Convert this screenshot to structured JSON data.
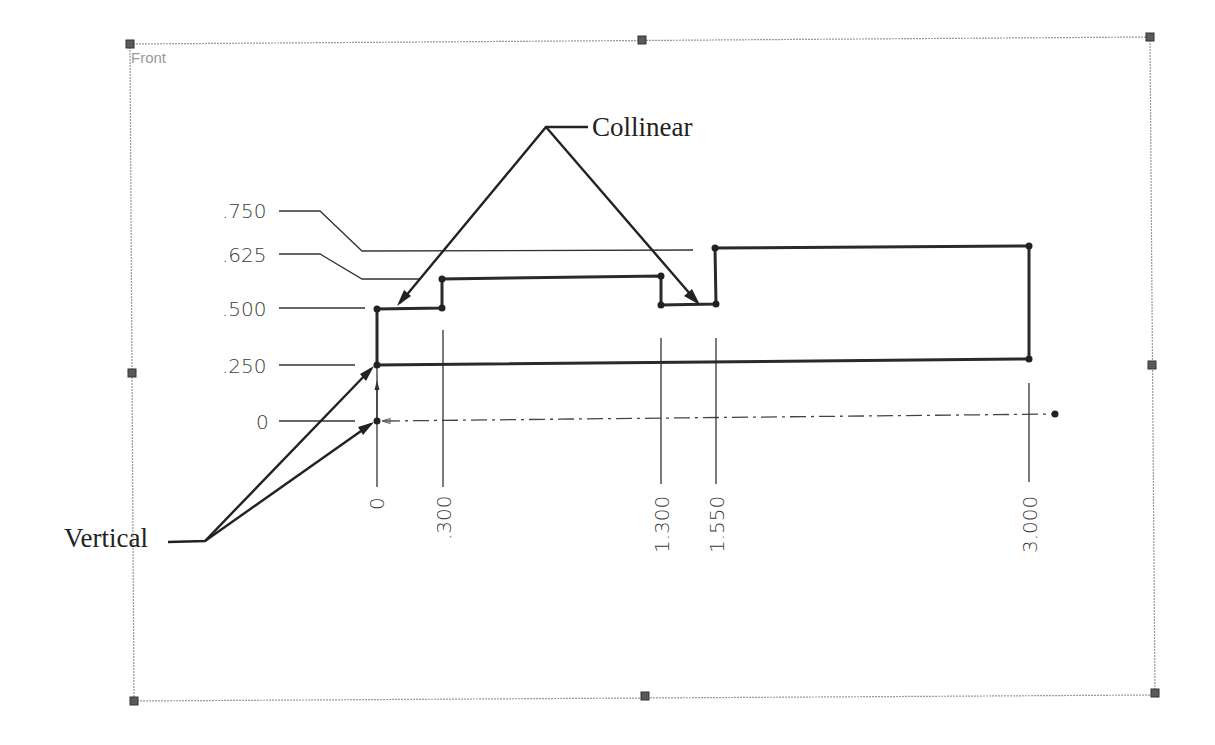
{
  "view": {
    "label": "Front"
  },
  "vertical_ordinates": {
    "labels": [
      ".750",
      ".625",
      ".500",
      ".250",
      "0"
    ]
  },
  "horizontal_ordinates": {
    "labels": [
      "0",
      ".300",
      "1.300",
      "1.550",
      "3.000"
    ]
  },
  "callouts": {
    "collinear": "Collinear",
    "vertical": "Vertical"
  },
  "colors": {
    "profile": "#2a2a2a",
    "frame": "#9a9a9a",
    "handle": "#5a5a5a"
  },
  "geometry": {
    "profile_points_in": [
      [
        0,
        0.25
      ],
      [
        0,
        0.5
      ],
      [
        0.3,
        0.5
      ],
      [
        0.3,
        0.625
      ],
      [
        1.3,
        0.625
      ],
      [
        1.3,
        0.5
      ],
      [
        1.55,
        0.5
      ],
      [
        1.55,
        0.75
      ],
      [
        3.0,
        0.75
      ],
      [
        3.0,
        0.25
      ]
    ]
  }
}
